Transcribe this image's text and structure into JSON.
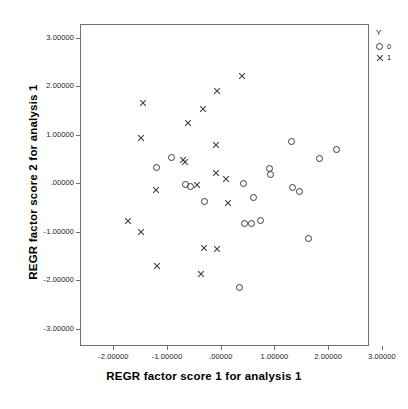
{
  "chart_data": {
    "type": "scatter",
    "title": "",
    "xlabel": "REGR factor score   1 for analysis 1",
    "ylabel": "REGR factor score   2 for analysis 1",
    "xlim": [
      -2.62,
      2.76
    ],
    "ylim": [
      -3.36,
      3.29
    ],
    "grid": false,
    "legend_position": "top-right",
    "legend_title": "Y",
    "xticks": [
      -2,
      -1,
      0,
      1,
      2,
      3
    ],
    "yticks": [
      3,
      2,
      1,
      0,
      -1,
      -2,
      -3
    ],
    "xticklabels": [
      "-2.00000",
      "-1.00000",
      ".00000",
      "1.00000",
      "2.00000",
      "3.00000"
    ],
    "yticklabels": [
      "3.00000",
      "2.00000",
      "1.00000",
      ".00000",
      "-1.00000",
      "-2.00000",
      "-3.00000"
    ],
    "series": [
      {
        "name": "0",
        "marker": "circle",
        "color": "#3a3a3a",
        "points": [
          [
            -1.22,
            0.35
          ],
          [
            -0.94,
            0.56
          ],
          [
            -0.58,
            -0.04
          ],
          [
            -0.68,
            -0.01
          ],
          [
            -0.33,
            -0.35
          ],
          [
            0.41,
            0.02
          ],
          [
            0.6,
            -0.27
          ],
          [
            0.89,
            0.33
          ],
          [
            0.91,
            0.2
          ],
          [
            1.3,
            0.89
          ],
          [
            1.31,
            -0.07
          ],
          [
            1.44,
            -0.15
          ],
          [
            1.82,
            0.54
          ],
          [
            2.13,
            0.71
          ],
          [
            1.61,
            -1.11
          ],
          [
            0.42,
            -0.81
          ],
          [
            0.56,
            -0.8
          ],
          [
            0.73,
            -0.75
          ],
          [
            0.33,
            -2.13
          ]
        ]
      },
      {
        "name": "1",
        "marker": "cross",
        "color": "#3a3a3a",
        "points": [
          [
            -1.47,
            1.68
          ],
          [
            -1.51,
            0.95
          ],
          [
            -1.22,
            -0.11
          ],
          [
            -1.74,
            -0.75
          ],
          [
            -1.51,
            -0.98
          ],
          [
            -1.2,
            -1.69
          ],
          [
            -0.63,
            1.26
          ],
          [
            -0.35,
            1.55
          ],
          [
            -0.08,
            1.92
          ],
          [
            0.38,
            2.23
          ],
          [
            -0.11,
            0.82
          ],
          [
            -0.72,
            0.5
          ],
          [
            -0.68,
            0.46
          ],
          [
            -0.46,
            -0.01
          ],
          [
            -0.1,
            0.23
          ],
          [
            0.08,
            0.11
          ],
          [
            0.11,
            -0.38
          ],
          [
            -0.33,
            -1.31
          ],
          [
            -0.09,
            -1.34
          ],
          [
            -0.38,
            -1.86
          ]
        ]
      }
    ]
  },
  "legend": {
    "title": "Y",
    "entries": [
      {
        "label": "0",
        "marker": "circle-icon"
      },
      {
        "label": "1",
        "marker": "cross-icon"
      }
    ]
  },
  "axes": {
    "x_title": "REGR factor score   1 for analysis 1",
    "y_title": "REGR factor score   2 for analysis 1"
  }
}
